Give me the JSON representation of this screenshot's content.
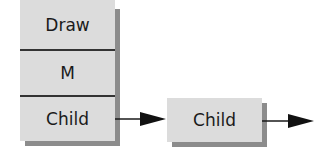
{
  "diagram": {
    "stack_node": {
      "cells": [
        {
          "label": "Draw"
        },
        {
          "label": "M"
        },
        {
          "label": "Child"
        }
      ]
    },
    "child_node": {
      "label": "Child"
    },
    "colors": {
      "box_fill": "#dcdcdc",
      "shadow": "#8c8c8c",
      "line": "#1a1a1a"
    }
  }
}
